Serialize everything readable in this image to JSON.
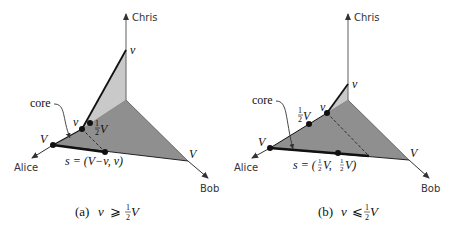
{
  "axes": {
    "x_label": "Alice",
    "y_label": "Bob",
    "z_label": "Chris"
  },
  "colors": {
    "dark_face": "#8f8f8f",
    "light_face": "#c9c9c9",
    "axis": "#777777",
    "core_line": "#111111"
  },
  "panels": [
    {
      "id": "a",
      "labels": {
        "chris_v": "v",
        "alice_V": "V",
        "bob_V": "V",
        "point_v": "v",
        "half_num": "1",
        "half_den": "2",
        "half_V": "V",
        "core": "core",
        "s_formula": "s = (V−v, v)"
      },
      "caption": {
        "prefix": "(a)",
        "var": "v",
        "rel": "⩾",
        "num": "1",
        "den": "2",
        "V": "V"
      }
    },
    {
      "id": "b",
      "labels": {
        "chris_v": "v",
        "alice_V": "V",
        "bob_V": "V",
        "point_v": "v",
        "half_num": "1",
        "half_den": "2",
        "half_V": "V",
        "core": "core",
        "s_prefix": "s = (",
        "s_num1": "1",
        "s_den1": "2",
        "s_mid": "V, ",
        "s_num2": "1",
        "s_den2": "2",
        "s_suffix": "V)"
      },
      "caption": {
        "prefix": "(b)",
        "var": "v",
        "rel": "⩽",
        "num": "1",
        "den": "2",
        "V": "V"
      }
    }
  ]
}
